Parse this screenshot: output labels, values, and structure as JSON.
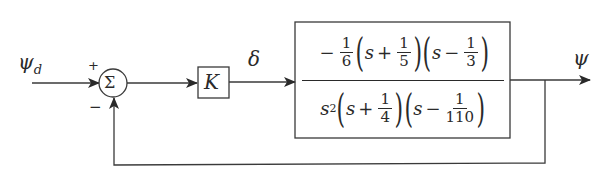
{
  "diagram": {
    "type": "feedback_control_block_diagram",
    "input_signal": "ψ_d",
    "input_label": "ψ",
    "input_subscript": "d",
    "summing_junction": {
      "symbol": "Σ",
      "plus_sign": "+",
      "minus_sign": "−"
    },
    "gain_block": {
      "label": "K"
    },
    "intermediate_signal": "δ",
    "plant_block": {
      "transfer_function": "−(1/6)(s + 1/5)(s − 1/3) / [s^2 (s + 1/4)(s − 1/110)]",
      "numerator": {
        "leading_sign": "−",
        "gain_num": "1",
        "gain_den": "6",
        "factor1": {
          "var": "s",
          "op": "+",
          "num": "1",
          "den": "5"
        },
        "factor2": {
          "var": "s",
          "op": "−",
          "num": "1",
          "den": "3"
        }
      },
      "denominator": {
        "var_power": "s",
        "power": "2",
        "factor1": {
          "var": "s",
          "op": "+",
          "num": "1",
          "den": "4"
        },
        "factor2": {
          "var": "s",
          "op": "−",
          "num": "1",
          "den": "110"
        }
      }
    },
    "output_signal": "ψ",
    "feedback": "unity negative feedback from ψ to summing junction",
    "colors": {
      "line": "#3a3a3a",
      "background": "#ffffff"
    }
  }
}
